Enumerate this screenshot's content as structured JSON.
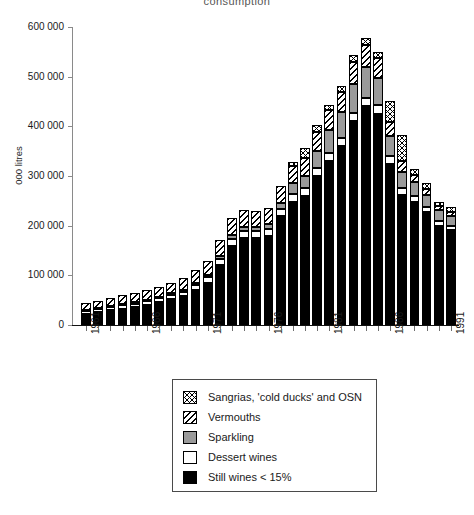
{
  "chart_data": {
    "type": "bar",
    "subtype": "stacked-bar",
    "title": "consumption",
    "xlabel": "",
    "ylabel": "000 litres",
    "ylim": [
      0,
      600000
    ],
    "ytick_step": 100000,
    "ytick_labels": [
      "0",
      "100 000",
      "200 000",
      "300 000",
      "400 000",
      "500 000",
      "600 000"
    ],
    "ytick_values": [
      0,
      100000,
      200000,
      300000,
      400000,
      500000,
      600000
    ],
    "grid": false,
    "legend_position": "below-plot",
    "categories": [
      "1961",
      "1962",
      "1963",
      "1964",
      "1965",
      "1966",
      "1967",
      "1968",
      "1969",
      "1970",
      "1971",
      "1972",
      "1973",
      "1974",
      "1975",
      "1976",
      "1977",
      "1978",
      "1979",
      "1980",
      "1981",
      "1982",
      "1983",
      "1984",
      "1985",
      "1986",
      "1987",
      "1988",
      "1989",
      "1990",
      "1991"
    ],
    "xtick_labeled": [
      "1961",
      "1966",
      "1971",
      "1976",
      "1981",
      "1986",
      "1991"
    ],
    "series": [
      {
        "name": "Still wines < 15%",
        "key": "still",
        "pattern": "solid-black",
        "color": "#000000",
        "values": [
          22000,
          26000,
          30000,
          33000,
          36000,
          40000,
          46000,
          52000,
          58000,
          70000,
          85000,
          120000,
          160000,
          175000,
          175000,
          180000,
          220000,
          248000,
          260000,
          300000,
          330000,
          360000,
          410000,
          440000,
          425000,
          325000,
          262000,
          248000,
          228000,
          200000,
          192000
        ]
      },
      {
        "name": "Dessert wines",
        "key": "dessert",
        "pattern": "white",
        "color": "#ffffff",
        "values": [
          6000,
          6000,
          7000,
          7000,
          7000,
          8000,
          8000,
          8000,
          9000,
          10000,
          11000,
          13000,
          14000,
          14000,
          14000,
          14000,
          14000,
          15000,
          15000,
          16000,
          16000,
          16000,
          17000,
          18000,
          17000,
          15000,
          13000,
          11000,
          10000,
          9000,
          8000
        ]
      },
      {
        "name": "Sparkling",
        "key": "sparkling",
        "pattern": "solid-gray",
        "color": "#9a9a9a",
        "values": [
          2000,
          2000,
          2000,
          2500,
          2500,
          3000,
          3000,
          3500,
          4000,
          4000,
          5000,
          6000,
          7000,
          8000,
          8000,
          9000,
          12000,
          22000,
          26000,
          34000,
          46000,
          52000,
          58000,
          62000,
          56000,
          40000,
          34000,
          28000,
          24000,
          22000,
          20000
        ]
      },
      {
        "name": "Vermouths",
        "key": "vermouth",
        "pattern": "diagonal-hatch",
        "color": "#ffffff",
        "values": [
          14000,
          15000,
          16000,
          17000,
          18000,
          19000,
          20000,
          22000,
          24000,
          26000,
          28000,
          32000,
          34000,
          34000,
          32000,
          32000,
          34000,
          36000,
          36000,
          38000,
          40000,
          42000,
          44000,
          44000,
          40000,
          28000,
          22000,
          16000,
          12000,
          9000,
          8000
        ]
      },
      {
        "name": "Sangrias, 'cold ducks' and OSN",
        "key": "sangria",
        "pattern": "cross-hatch",
        "color": "#ffffff",
        "values": [
          0,
          0,
          0,
          0,
          0,
          0,
          0,
          0,
          0,
          0,
          0,
          0,
          0,
          0,
          0,
          0,
          0,
          8000,
          20000,
          14000,
          12000,
          12000,
          14000,
          14000,
          12000,
          44000,
          52000,
          12000,
          12000,
          8000,
          9000
        ]
      }
    ]
  },
  "legend": {
    "items": [
      {
        "label": "Sangrias, 'cold ducks' and OSN",
        "key": "sangria"
      },
      {
        "label": "Vermouths",
        "key": "vermouth"
      },
      {
        "label": "Sparkling",
        "key": "sparkling"
      },
      {
        "label": "Dessert wines",
        "key": "dessert"
      },
      {
        "label": "Still wines < 15%",
        "key": "still"
      }
    ]
  }
}
